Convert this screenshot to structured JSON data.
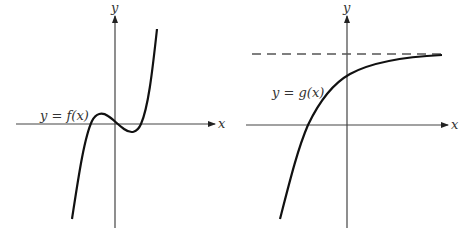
{
  "panels": [
    {
      "id": "left",
      "x_axis_label": "x",
      "y_axis_label": "y",
      "curve_label": "y = f(x)",
      "description": "cubic curve with local max left of origin, passing through origin, local min right of origin"
    },
    {
      "id": "right",
      "x_axis_label": "x",
      "y_axis_label": "y",
      "curve_label": "y = g(x)",
      "description": "increasing exponential-type curve approaching a horizontal dashed asymptote from below"
    }
  ],
  "colors": {
    "curve": "#111111",
    "axis": "#444444",
    "asymptote": "#555555"
  }
}
